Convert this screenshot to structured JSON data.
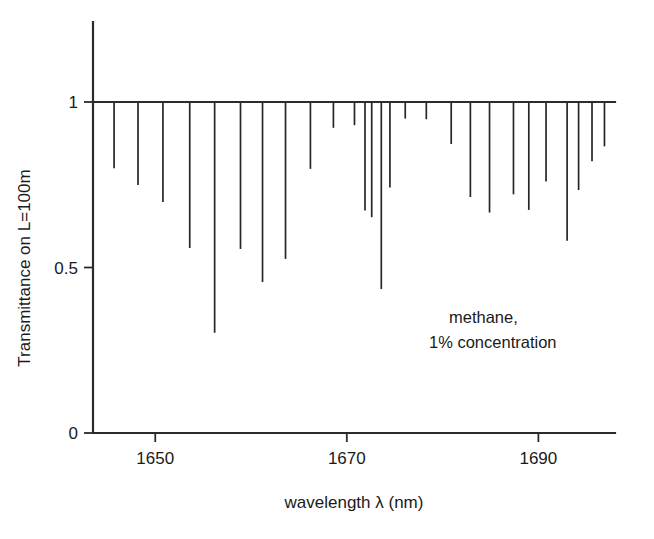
{
  "chart_data": {
    "type": "bar",
    "title": "",
    "xlabel": "wavelength λ (nm)",
    "ylabel": "Transmittance on L=100m",
    "xlim": [
      1643.5,
      1698.0
    ],
    "ylim": [
      0,
      1.08
    ],
    "grid": false,
    "legend": null,
    "xticks": [
      1650,
      1670,
      1690
    ],
    "xtick_labels": [
      "1650",
      "1670",
      "1690"
    ],
    "yticks": [
      0,
      0.5,
      1
    ],
    "ytick_labels": [
      "0",
      "0.5",
      "1"
    ],
    "baseline": 1.0,
    "annotations": [
      {
        "text": "methane,",
        "x": 1682.5,
        "y": 0.345
      },
      {
        "text": "1% concentration",
        "x": 1682.5,
        "y": 0.275
      }
    ],
    "x": [
      1645.7,
      1648.2,
      1650.8,
      1653.6,
      1656.2,
      1658.9,
      1661.2,
      1663.6,
      1666.2,
      1668.6,
      1670.8,
      1671.9,
      1672.6,
      1673.6,
      1674.5,
      1676.1,
      1678.3,
      1680.9,
      1682.9,
      1684.9,
      1687.4,
      1689.0,
      1690.8,
      1693.0,
      1694.2,
      1695.6,
      1696.9
    ],
    "values": [
      0.8,
      0.749,
      0.698,
      0.559,
      0.303,
      0.556,
      0.456,
      0.526,
      0.798,
      0.922,
      0.93,
      0.672,
      0.652,
      0.435,
      0.742,
      0.95,
      0.948,
      0.873,
      0.713,
      0.666,
      0.721,
      0.674,
      0.76,
      0.581,
      0.734,
      0.821,
      0.866
    ],
    "series_name": "methane transmittance, 1% concentration, L=100 m"
  },
  "axes": {
    "x_title": "wavelength λ (nm)",
    "y_title": "Transmittance on L=100m",
    "x_tick_labels": [
      "1650",
      "1670",
      "1690"
    ],
    "y_tick_labels": [
      "1",
      "0.5",
      "0"
    ]
  },
  "annotation": {
    "line1": "methane,",
    "line2": "1% concentration"
  },
  "style": {
    "line_color": "#262626",
    "axis_color": "#2b2b2b",
    "background": "#ffffff"
  }
}
